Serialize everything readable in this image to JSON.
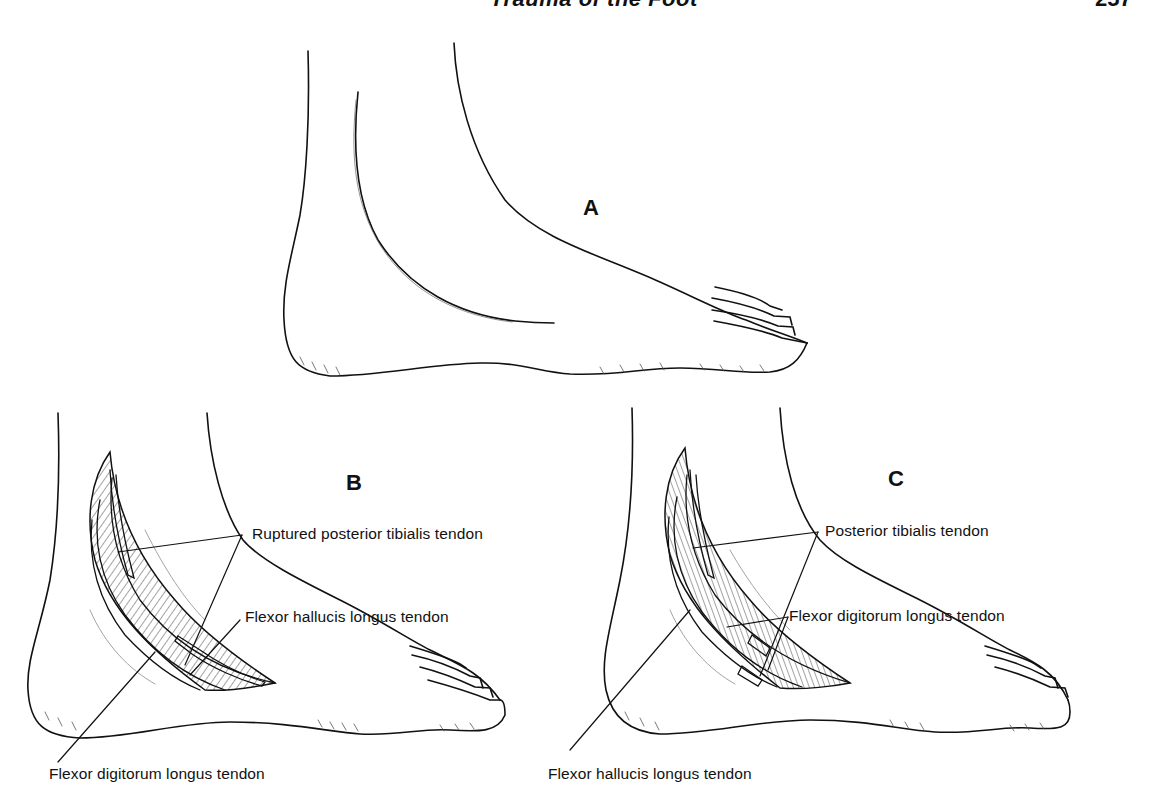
{
  "page": {
    "running_head": "Trauma of the Foot",
    "page_number": "257"
  },
  "figure": {
    "panels": [
      {
        "id": "A",
        "letter": "A",
        "labels": []
      },
      {
        "id": "B",
        "letter": "B",
        "labels": [
          "Ruptured posterior tibialis tendon",
          "Flexor hallucis longus tendon",
          "Flexor digitorum longus tendon"
        ]
      },
      {
        "id": "C",
        "letter": "C",
        "labels": [
          "Posterior tibialis tendon",
          "Flexor digitorum longus tendon",
          "Flexor hallucis longus tendon"
        ]
      }
    ],
    "colors": {
      "ink": "#111111",
      "hatch": "#333333",
      "faint": "#999999",
      "paper": "#ffffff"
    }
  }
}
